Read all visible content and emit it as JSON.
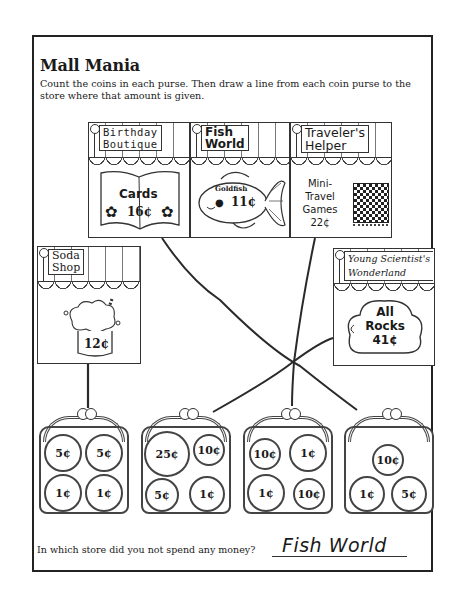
{
  "worksheet": {
    "title": "Mall Mania",
    "instructions": "Count the coins in each purse. Then draw a line from each coin purse to the store where that amount is given.",
    "question": "In which store did you not spend any money?",
    "answer": "Fish World"
  },
  "stores": [
    {
      "name_line1": "Birthday",
      "name_line2": "Boutique",
      "item": "Cards",
      "price": "16¢",
      "icon": "flower-icon"
    },
    {
      "name_line1": "Fish",
      "name_line2": "World",
      "item": "Goldfish",
      "price": "11¢",
      "icon": "goldfish-icon"
    },
    {
      "name_line1": "Traveler's",
      "name_line2": "Helper",
      "item_line1": "Mini-",
      "item_line2": "Travel",
      "item_line3": "Games",
      "price": "22¢",
      "icon": "checkerboard-icon"
    },
    {
      "name_line1": "Soda",
      "name_line2": "Shop",
      "price": "12¢",
      "icon": "soda-icon"
    },
    {
      "name_line1": "Young Scientist's",
      "name_line2": "Wonderland",
      "item_line1": "All",
      "item_line2": "Rocks",
      "price": "41¢",
      "icon": "rock-icon"
    }
  ],
  "purses": [
    {
      "coins": [
        "5¢",
        "5¢",
        "1¢",
        "1¢"
      ],
      "total": "12¢",
      "matched_store": "Soda Shop"
    },
    {
      "coins": [
        "25¢",
        "10¢",
        "5¢",
        "1¢"
      ],
      "total": "41¢",
      "matched_store": "Young Scientist's Wonderland"
    },
    {
      "coins": [
        "10¢",
        "1¢",
        "1¢",
        "10¢"
      ],
      "total": "22¢",
      "matched_store": "Traveler's Helper"
    },
    {
      "coins": [
        "10¢",
        "1¢",
        "5¢"
      ],
      "total": "16¢",
      "matched_store": "Birthday Boutique"
    }
  ],
  "colors": {
    "ink": "#1a1a1a",
    "paper": "#ffffff",
    "line": "#2a2a2a"
  }
}
